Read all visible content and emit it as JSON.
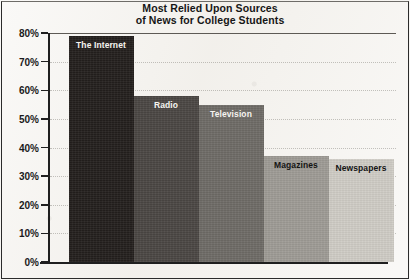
{
  "chart_data": {
    "type": "bar",
    "title": "Most Relied Upon Sources of News for College Students",
    "title_lines": [
      "Most Relied Upon Sources",
      "of News for College Students"
    ],
    "xlabel": "",
    "ylabel": "",
    "ylim": [
      0,
      80
    ],
    "ytick_labels": [
      "80%",
      "70%",
      "60%",
      "50%",
      "40%",
      "30%",
      "20%",
      "10%",
      "0%"
    ],
    "ytick_values": [
      80,
      70,
      60,
      50,
      40,
      30,
      20,
      10,
      0
    ],
    "grid": true,
    "legend": "none",
    "categories": [
      "The Internet",
      "Radio",
      "Television",
      "Magazines",
      "Newspapers"
    ],
    "values": [
      79,
      58,
      55,
      37,
      36
    ],
    "bar_colors": [
      "#231f1d",
      "#4a4643",
      "#6e6b66",
      "#9e9b95",
      "#cfccc5"
    ],
    "label_text_colors": [
      "light",
      "light",
      "light",
      "dark",
      "dark"
    ]
  },
  "page": {
    "background_color": "#f4f2ee",
    "axis_color": "#1f1f1f",
    "text_color": "#161616"
  }
}
